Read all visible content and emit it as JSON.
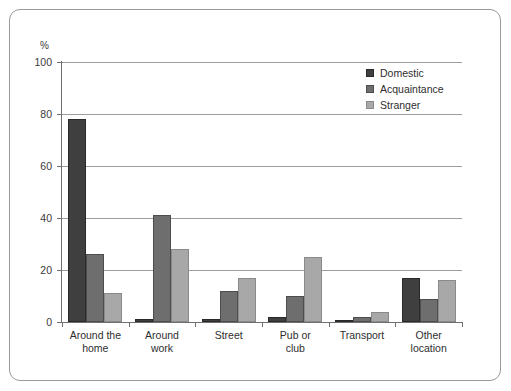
{
  "frame": {
    "border_color": "#9a9a9a"
  },
  "chart_data": {
    "type": "bar",
    "title": "",
    "subtitle": "",
    "xlabel": "",
    "ylabel": "%",
    "ylim": [
      0,
      100
    ],
    "yticks": [
      0,
      20,
      40,
      60,
      80,
      100
    ],
    "ytick_labels": [
      "0",
      "20",
      "40",
      "60",
      "80",
      "100"
    ],
    "grid": true,
    "grid_axis": "y",
    "legend_position": "top-right",
    "categories": [
      "Around the home",
      "Around work",
      "Street",
      "Pub or club",
      "Transport",
      "Other location"
    ],
    "category_lines": [
      [
        "Around the",
        "home"
      ],
      [
        "Around",
        "work"
      ],
      [
        "Street",
        ""
      ],
      [
        "Pub or",
        "club"
      ],
      [
        "Transport",
        ""
      ],
      [
        "Other",
        "location"
      ]
    ],
    "series": [
      {
        "name": "Domestic",
        "color": "#3f3f3f",
        "values": [
          78,
          1,
          1,
          2,
          0.3,
          17
        ]
      },
      {
        "name": "Acquaintance",
        "color": "#6e6e6e",
        "values": [
          26,
          41,
          12,
          10,
          2,
          9
        ]
      },
      {
        "name": "Stranger",
        "color": "#a8a8a8",
        "values": [
          11,
          28,
          17,
          25,
          4,
          16
        ]
      }
    ]
  }
}
